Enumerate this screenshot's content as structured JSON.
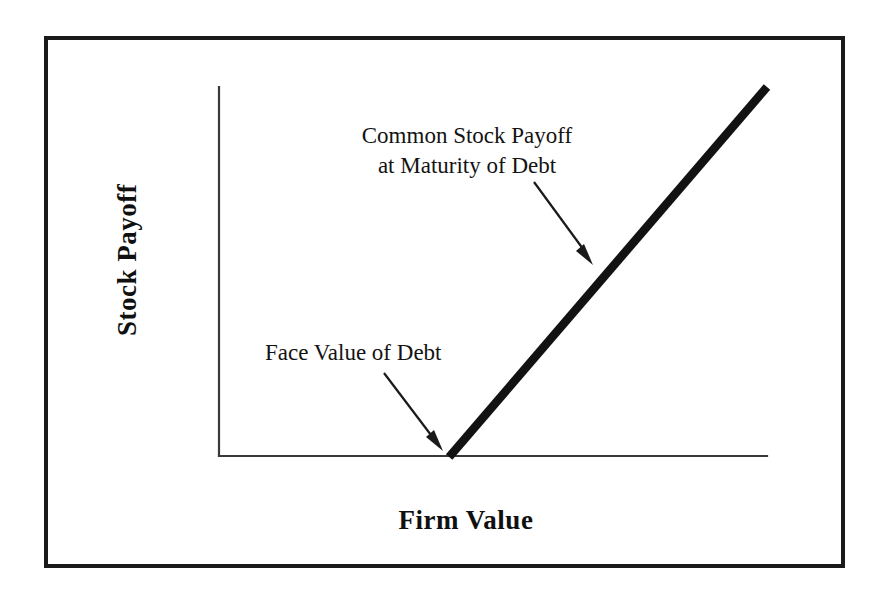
{
  "figure": {
    "background_color": "#ffffff",
    "frame_color": "#1a1a1a",
    "line_color": "#121212",
    "axis_color": "#3a3a3a"
  },
  "axes": {
    "y_title": "Stock Payoff",
    "x_title": "Firm Value"
  },
  "annotations": {
    "payoff": {
      "line1": "Common Stock Payoff",
      "line2": "at Maturity of Debt"
    },
    "face_value": {
      "line1": "Face Value of Debt"
    }
  },
  "chart_data": {
    "type": "line",
    "title": "",
    "subtitle": "",
    "xlabel": "Firm Value",
    "ylabel": "Stock Payoff",
    "xlim": [
      0,
      100
    ],
    "ylim": [
      0,
      100
    ],
    "grid": false,
    "legend_position": "none",
    "axis_ticks": {
      "x": [],
      "y": []
    },
    "series": [
      {
        "name": "Common Stock Payoff at Maturity of Debt",
        "description": "Hockey-stick payoff: zero until firm value reaches the face value of debt, then increasing one-for-one with firm value.",
        "x": [
          42,
          100
        ],
        "y": [
          0,
          100
        ],
        "linewidth": "thick",
        "color": "#121212"
      }
    ],
    "annotations": [
      {
        "text": "Common Stock Payoff at Maturity of Debt",
        "text_x": 47,
        "text_y": 86,
        "arrow_to_x": 68,
        "arrow_to_y": 53
      },
      {
        "text": "Face Value of Debt",
        "text_x": 18,
        "text_y": 26,
        "arrow_to_x": 42,
        "arrow_to_y": 2
      }
    ]
  }
}
